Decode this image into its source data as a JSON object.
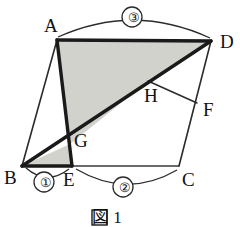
{
  "figure": {
    "caption": "図 1",
    "background_color": "#ffffff",
    "stroke_color": "#1a1a1a",
    "shade_color": "#d2d2cd",
    "thin_stroke_color": "#3a3a3a"
  },
  "vertices": [
    {
      "id": "A",
      "label": "A",
      "x": 57,
      "y": 40,
      "label_x": 44,
      "label_y": 16
    },
    {
      "id": "B",
      "label": "B",
      "x": 22,
      "y": 166,
      "label_x": 6,
      "label_y": 170
    },
    {
      "id": "C",
      "label": "C",
      "x": 179,
      "y": 166,
      "label_x": 182,
      "label_y": 172
    },
    {
      "id": "D",
      "label": "D",
      "x": 211,
      "y": 41,
      "label_x": 220,
      "label_y": 33
    },
    {
      "id": "E",
      "label": "E",
      "x": 72,
      "y": 166,
      "label_x": 64,
      "label_y": 172
    },
    {
      "id": "F",
      "label": "F",
      "x": 197,
      "y": 103,
      "label_x": 204,
      "label_y": 102
    },
    {
      "id": "G",
      "label": "G",
      "x": 70,
      "y": 144,
      "label_x": 74,
      "label_y": 133
    },
    {
      "id": "H",
      "label": "H",
      "x": 148,
      "y": 81,
      "label_x": 145,
      "label_y": 88
    }
  ],
  "arcs": [
    {
      "id": "arc-1",
      "label": "①",
      "from": "B",
      "to": "E",
      "label_x": 38,
      "label_y": 176
    },
    {
      "id": "arc-2",
      "label": "②",
      "from": "E",
      "to": "C",
      "label_x": 117,
      "label_y": 181
    },
    {
      "id": "arc-3",
      "label": "③",
      "from": "A",
      "to": "D",
      "label_x": 126,
      "label_y": 11
    }
  ],
  "segments": [
    {
      "id": "segment-AB",
      "from": "A",
      "to": "B",
      "weight": "thin"
    },
    {
      "id": "segment-AD",
      "from": "A",
      "to": "D",
      "weight": "thick"
    },
    {
      "id": "segment-AE",
      "from": "A",
      "to": "E",
      "weight": "thick"
    },
    {
      "id": "segment-BD",
      "from": "B",
      "to": "D",
      "weight": "thick"
    },
    {
      "id": "segment-BE",
      "from": "B",
      "to": "E",
      "weight": "thick"
    },
    {
      "id": "segment-EC",
      "from": "E",
      "to": "C",
      "weight": "thin"
    },
    {
      "id": "segment-DC",
      "from": "D",
      "to": "C",
      "weight": "thin"
    },
    {
      "id": "segment-HF",
      "from": "H",
      "to": "F",
      "weight": "thin"
    }
  ],
  "shaded_regions": [
    {
      "id": "region-AEGH-upper",
      "points": "A,D,H,G,E",
      "note": "quadrilateral shading between A-D, D-H, H-G, G-E path"
    },
    {
      "id": "region-BGE-lower",
      "points": "B,G,E",
      "note": "triangle at lower left"
    }
  ]
}
